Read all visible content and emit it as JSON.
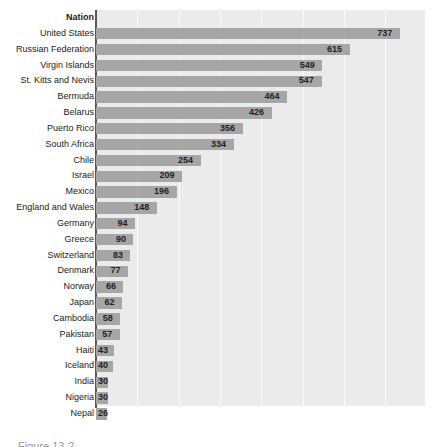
{
  "chart_data": {
    "type": "bar",
    "orientation": "horizontal",
    "title": "",
    "xlabel": "",
    "ylabel": "",
    "header_label": "Nation",
    "grid": true,
    "gridlines_vertical": true,
    "legend": "none",
    "xlim": [
      0,
      800
    ],
    "categories": [
      "United States",
      "Russian Federation",
      "Virgin Islands",
      "St. Kitts and Nevis",
      "Bermuda",
      "Belarus",
      "Puerto Rico",
      "South Africa",
      "Chile",
      "Israel",
      "Mexico",
      "England and Wales",
      "Germany",
      "Greece",
      "Switzerland",
      "Denmark",
      "Norway",
      "Japan",
      "Cambodia",
      "Pakistan",
      "Haiti",
      "Iceland",
      "India",
      "Nigeria",
      "Nepal"
    ],
    "values": [
      737,
      615,
      549,
      547,
      464,
      426,
      356,
      334,
      254,
      209,
      196,
      148,
      94,
      90,
      83,
      77,
      66,
      62,
      58,
      57,
      43,
      40,
      30,
      30,
      26
    ]
  },
  "style": {
    "bar_color": "#a6a6a6",
    "plot_background": "#ebebeb",
    "gridline_color": "#fafafa",
    "axis_color": "#585858",
    "label_color": "#1a1a1a",
    "page_background": "#ffffff"
  },
  "caption": {
    "text": "Figure 13-2"
  }
}
